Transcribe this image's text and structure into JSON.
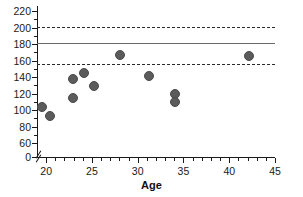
{
  "chart_data": {
    "type": "scatter",
    "title": "",
    "xlabel": "Age",
    "ylabel": "",
    "xlim": [
      19,
      45
    ],
    "ylim": [
      50,
      224
    ],
    "grid": false,
    "legend": "none",
    "x_ticks": [
      20,
      25,
      30,
      35,
      40,
      45
    ],
    "y_ticks": [
      0,
      60,
      80,
      100,
      120,
      140,
      160,
      180,
      200,
      220
    ],
    "y_axis_break": true,
    "y_axis_break_note": "axis broken between 0 and 60",
    "points": [
      {
        "x": 19.6,
        "y": 104
      },
      {
        "x": 20.4,
        "y": 93
      },
      {
        "x": 22.9,
        "y": 137
      },
      {
        "x": 22.9,
        "y": 114
      },
      {
        "x": 24.1,
        "y": 145
      },
      {
        "x": 25.2,
        "y": 129
      },
      {
        "x": 28.1,
        "y": 167
      },
      {
        "x": 31.2,
        "y": 141
      },
      {
        "x": 34.1,
        "y": 119
      },
      {
        "x": 34.1,
        "y": 110
      },
      {
        "x": 42.2,
        "y": 166
      }
    ],
    "reference_lines": [
      {
        "name": "upper-limit",
        "value": 201,
        "style": "dashed"
      },
      {
        "name": "mean",
        "value": 181,
        "style": "solid"
      },
      {
        "name": "lower-limit",
        "value": 156,
        "style": "dashed"
      }
    ],
    "colors": {
      "marker": "#5b5b5b",
      "axis": "#1a1a1a",
      "mean_line": "#6a6a6a",
      "limit_line": "#2a2a2a",
      "background": "#ffffff"
    }
  }
}
